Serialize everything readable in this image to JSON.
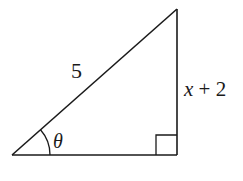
{
  "diagram": {
    "type": "right-triangle",
    "stroke_color": "#1a1a1a",
    "vertices": {
      "bottom_left": [
        12,
        155
      ],
      "bottom_right": [
        177,
        155
      ],
      "top_right": [
        177,
        9
      ]
    },
    "right_angle_marker": {
      "position": "bottom_right",
      "size": 21
    },
    "angle_arc": {
      "vertex": "bottom_left",
      "radius": 38
    },
    "labels": {
      "hypotenuse": "5",
      "vertical_side_variable": "x",
      "vertical_side_rest": " + 2",
      "angle": "θ"
    }
  }
}
